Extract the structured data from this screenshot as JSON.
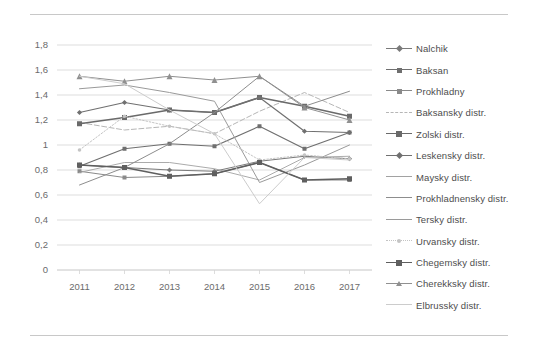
{
  "chart_data": {
    "type": "line",
    "title": "",
    "subtitle": "",
    "xlabel": "",
    "ylabel": "",
    "categories": [
      "2011",
      "2012",
      "2013",
      "2014",
      "2015",
      "2016",
      "2017"
    ],
    "x_tick_labels": [
      "2011",
      "2012",
      "2013",
      "2014",
      "2015",
      "2016",
      "2017"
    ],
    "y_tick_labels": [
      "0",
      "0,2",
      "0,4",
      "0,6",
      "0,8",
      "1",
      "1,2",
      "1,4",
      "1,6",
      "1,8"
    ],
    "y_tick_values": [
      0,
      0.2,
      0.4,
      0.6,
      0.8,
      1.0,
      1.2,
      1.4,
      1.6,
      1.8
    ],
    "ylim": [
      0,
      1.8
    ],
    "grid": true,
    "grid_axis": "y",
    "legend_position": "right",
    "decimal_separator": ",",
    "series": [
      {
        "name": "Nalchik",
        "marker": "diamond",
        "color": "#7a7a7a",
        "line": "solid",
        "width": 1.0,
        "values": [
          0.84,
          0.82,
          0.8,
          0.79,
          0.87,
          0.91,
          0.89
        ]
      },
      {
        "name": "Baksan",
        "marker": "square",
        "color": "#6f6f6f",
        "line": "solid",
        "width": 1.2,
        "values": [
          0.83,
          0.97,
          1.01,
          0.99,
          1.15,
          0.97,
          1.1
        ]
      },
      {
        "name": "Prokhladny",
        "marker": "square",
        "color": "#8a8a8a",
        "line": "solid",
        "width": 1.0,
        "values": [
          0.79,
          0.74,
          0.75,
          0.77,
          0.86,
          0.72,
          0.72
        ]
      },
      {
        "name": "Baksansky distr.",
        "marker": "none",
        "color": "#b6b6b6",
        "line": "dashed",
        "width": 1.0,
        "values": [
          1.18,
          1.12,
          1.15,
          1.09,
          1.27,
          1.42,
          1.26
        ]
      },
      {
        "name": "Zolski distr.",
        "marker": "square",
        "color": "#6a6a6a",
        "line": "solid",
        "width": 1.6,
        "values": [
          1.17,
          1.22,
          1.28,
          1.26,
          1.38,
          1.31,
          1.23
        ]
      },
      {
        "name": "Leskensky distr.",
        "marker": "diamond",
        "color": "#707070",
        "line": "solid",
        "width": 1.2,
        "values": [
          1.26,
          1.34,
          1.28,
          1.26,
          1.38,
          1.11,
          1.1
        ]
      },
      {
        "name": "Maysky distr.",
        "marker": "none",
        "color": "#a2a2a2",
        "line": "solid",
        "width": 0.9,
        "values": [
          0.78,
          0.86,
          0.86,
          0.81,
          0.72,
          0.9,
          0.91
        ]
      },
      {
        "name": "Prokhladnensky distr.",
        "marker": "none",
        "color": "#8d8d8d",
        "line": "solid",
        "width": 1.0,
        "values": [
          0.68,
          0.82,
          1.01,
          1.26,
          1.55,
          1.31,
          1.43
        ]
      },
      {
        "name": "Tersky distr.",
        "marker": "none",
        "color": "#9a9a9a",
        "line": "solid",
        "width": 1.0,
        "values": [
          1.45,
          1.48,
          1.42,
          1.35,
          0.7,
          0.84,
          1.0
        ]
      },
      {
        "name": "Urvansky distr.",
        "marker": "dot",
        "color": "#c4c4c4",
        "line": "dotted",
        "width": 1.0,
        "values": [
          0.96,
          1.23,
          1.15,
          1.09,
          0.88,
          0.92,
          0.89
        ]
      },
      {
        "name": "Chegemsky distr.",
        "marker": "square",
        "color": "#5f5f5f",
        "line": "solid",
        "width": 1.6,
        "values": [
          0.84,
          0.82,
          0.75,
          0.77,
          0.86,
          0.72,
          0.73
        ]
      },
      {
        "name": "Cherekksky distr.",
        "marker": "triangle",
        "color": "#909090",
        "line": "solid",
        "width": 1.0,
        "values": [
          1.55,
          1.51,
          1.55,
          1.52,
          1.55,
          1.3,
          1.2
        ]
      },
      {
        "name": "Elbrussky distr.",
        "marker": "none",
        "color": "#cccccc",
        "line": "solid",
        "width": 1.0,
        "values": [
          1.55,
          1.49,
          1.28,
          1.09,
          0.53,
          0.9,
          0.88
        ]
      }
    ]
  },
  "legend": {
    "items": [
      {
        "label": "Nalchik"
      },
      {
        "label": "Baksan"
      },
      {
        "label": "Prokhladny"
      },
      {
        "label": "Baksansky distr."
      },
      {
        "label": "Zolski distr."
      },
      {
        "label": "Leskensky distr."
      },
      {
        "label": "Maysky distr."
      },
      {
        "label": "Prokhladnensky distr."
      },
      {
        "label": "Tersky distr."
      },
      {
        "label": "Urvansky distr."
      },
      {
        "label": "Chegemsky distr."
      },
      {
        "label": "Cherekksky distr."
      },
      {
        "label": "Elbrussky distr."
      }
    ]
  },
  "colors": {
    "background": "#ffffff",
    "grid": "#d4d4d4",
    "frame": "#c8c8c8",
    "tick_text": "#6b6b6b"
  }
}
